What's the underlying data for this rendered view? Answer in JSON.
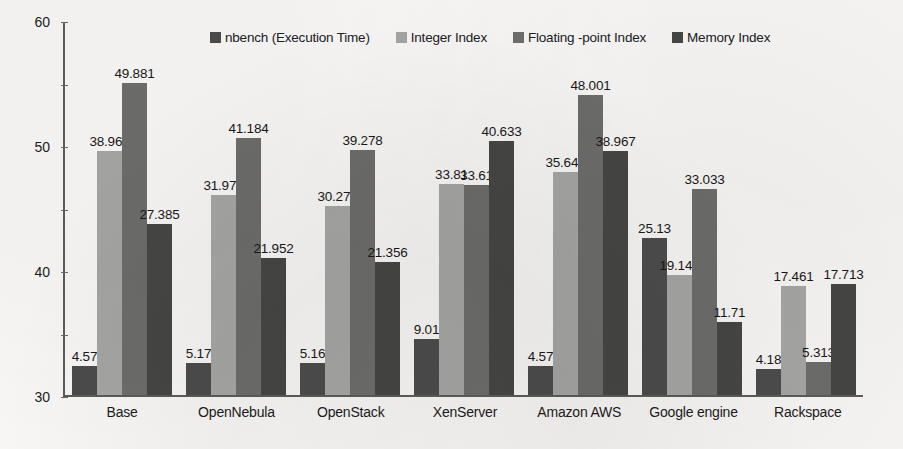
{
  "chart_data": {
    "type": "bar",
    "title": "",
    "subtitle": "",
    "xlabel": "",
    "ylabel": "",
    "ylim": [
      0,
      60
    ],
    "yticks": [
      0,
      10,
      20,
      30,
      40,
      50,
      60
    ],
    "ytick_labels": [
      "0",
      "10",
      "20",
      "30",
      "40",
      "50",
      "60"
    ],
    "grid": false,
    "legend_position": "top",
    "data_labels": true,
    "categories": [
      "Base",
      "OpenNebula",
      "OpenStack",
      "XenServer",
      "Amazon AWS",
      "Google engine",
      "Rackspace"
    ],
    "series": [
      {
        "name": "nbench (Execution Time)",
        "color": "#4d4d4d",
        "values": [
          4.57,
          5.17,
          5.16,
          9.01,
          4.57,
          25.13,
          4.18
        ],
        "labels": [
          "4.57",
          "5.17",
          "5.16",
          "9.01",
          "4.57",
          "25.13",
          "4.18"
        ]
      },
      {
        "name": "Integer Index",
        "color": "#a8a8a6",
        "values": [
          38.967,
          31.977,
          30.275,
          33.81,
          35.645,
          19.144,
          17.461
        ],
        "labels": [
          "38.967",
          "31.977",
          "30.275",
          "33.81",
          "35.645",
          "19.144",
          "17.461"
        ]
      },
      {
        "name": "Floating -point Index",
        "color": "#6e6e6c",
        "values": [
          49.881,
          41.184,
          39.278,
          33.61,
          48.001,
          33.033,
          5.313
        ],
        "labels": [
          "49.881",
          "41.184",
          "39.278",
          "33.61",
          "48.001",
          "33.033",
          "5.313"
        ]
      },
      {
        "name": "Memory Index",
        "color": "#474746",
        "values": [
          27.385,
          21.952,
          21.356,
          40.633,
          38.967,
          11.71,
          17.713
        ],
        "labels": [
          "27.385",
          "21.952",
          "21.356",
          "40.633",
          "38.967",
          "11.71",
          "17.713"
        ]
      }
    ]
  }
}
